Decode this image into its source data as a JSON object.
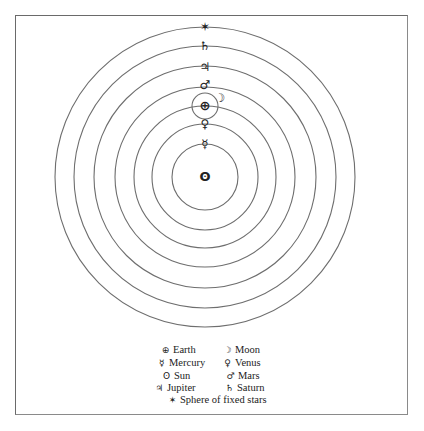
{
  "diagram": {
    "center": {
      "x": 205,
      "y": 177
    },
    "orbit_radii": [
      33,
      53,
      71,
      90,
      111,
      131,
      150
    ],
    "epicycle": {
      "center_x": 205,
      "center_y": 106,
      "radius": 13
    },
    "line_color": "#6e6e6e",
    "bodies": [
      {
        "name": "Sun",
        "symbol": "ʘ",
        "x": 205,
        "y": 177
      },
      {
        "name": "Mercury",
        "symbol": "☿",
        "x": 205,
        "y": 144
      },
      {
        "name": "Venus",
        "symbol": "♀",
        "x": 205,
        "y": 124
      },
      {
        "name": "Earth",
        "symbol": "⊕",
        "x": 205,
        "y": 106
      },
      {
        "name": "Moon",
        "symbol": "☽",
        "x": 220,
        "y": 98
      },
      {
        "name": "Mars",
        "symbol": "♂",
        "x": 205,
        "y": 85
      },
      {
        "name": "Jupiter",
        "symbol": "♃",
        "x": 205,
        "y": 67
      },
      {
        "name": "Saturn",
        "symbol": "♄",
        "x": 205,
        "y": 46
      },
      {
        "name": "Sphere of fixed stars",
        "symbol": "✶",
        "x": 205,
        "y": 27
      }
    ]
  },
  "legend": {
    "items": [
      {
        "symbol": "⊕",
        "label": "Earth"
      },
      {
        "symbol": "☽",
        "label": "Moon"
      },
      {
        "symbol": "☿",
        "label": "Mercury"
      },
      {
        "symbol": "♀",
        "label": "Venus"
      },
      {
        "symbol": "ʘ",
        "label": "Sun"
      },
      {
        "symbol": "♂",
        "label": "Mars"
      },
      {
        "symbol": "♃",
        "label": "Jupiter"
      },
      {
        "symbol": "♄",
        "label": "Saturn"
      },
      {
        "symbol": "✶",
        "label": "Sphere of fixed stars"
      }
    ]
  }
}
